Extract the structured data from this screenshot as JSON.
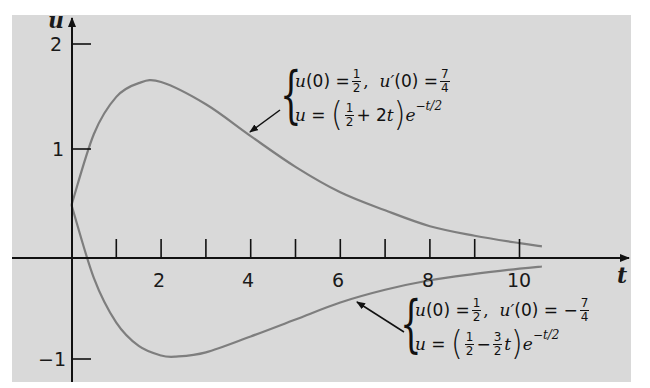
{
  "chart_data": {
    "type": "line",
    "title": "",
    "xlabel": "t",
    "ylabel": "u",
    "xlim": [
      0,
      11.8
    ],
    "ylim": [
      -1.15,
      2.2
    ],
    "x_ticks": [
      1,
      2,
      3,
      4,
      5,
      6,
      7,
      8,
      9,
      10
    ],
    "x_tick_labels": [
      "2",
      "4",
      "6",
      "8",
      "10"
    ],
    "x_tick_label_values": [
      2,
      4,
      6,
      8,
      10
    ],
    "y_ticks": [
      2,
      1,
      -1
    ],
    "y_tick_labels": [
      "2",
      "1",
      "−1"
    ],
    "grid": false,
    "legend": null,
    "series": [
      {
        "name": "upper",
        "formula": "(1/2 + 2t)e^(-t/2)",
        "initial_conditions": "u(0) = 1/2, u'(0) = 7/4",
        "t_range": [
          0,
          10.5
        ],
        "x": [
          0,
          0.5,
          1,
          1.5,
          2,
          3,
          4,
          5,
          6,
          7,
          8,
          9,
          10,
          10.5
        ],
        "values": [
          0.5,
          1.17,
          1.52,
          1.65,
          1.66,
          1.45,
          1.15,
          0.86,
          0.62,
          0.45,
          0.3,
          0.21,
          0.14,
          0.11
        ]
      },
      {
        "name": "lower",
        "formula": "(1/2 - 3/2 t)e^(-t/2)",
        "initial_conditions": "u(0) = 1/2, u'(0) = -7/4",
        "t_range": [
          0,
          10.5
        ],
        "x": [
          0,
          0.5,
          1,
          1.5,
          2,
          2.33,
          3,
          4,
          5,
          6,
          7,
          8,
          9,
          10,
          10.5
        ],
        "values": [
          0.5,
          -0.19,
          -0.61,
          -0.83,
          -0.92,
          -0.93,
          -0.89,
          -0.74,
          -0.58,
          -0.42,
          -0.3,
          -0.21,
          -0.15,
          -0.1,
          -0.08
        ]
      }
    ],
    "annotations": [
      {
        "target": "upper",
        "line1": "u(0) = 1/2,  u'(0) = 7/4",
        "line2": "u = (1/2 + 2t)e^(-t/2)"
      },
      {
        "target": "lower",
        "line1": "u(0) = 1/2,  u'(0) = −7/4",
        "line2": "u = (1/2 − 3/2 t)e^(-t/2)"
      }
    ]
  },
  "labels": {
    "x_axis": "t",
    "y_axis": "u",
    "y_tick_2": "2",
    "y_tick_1": "1",
    "y_tick_m1": "−1",
    "x_tick_2": "2",
    "x_tick_4": "4",
    "x_tick_6": "6",
    "x_tick_8": "8",
    "x_tick_10": "10"
  },
  "annot_upper": {
    "u0": "u",
    "u0_arg": "(0) =",
    "half_num": "1",
    "half_den": "2",
    "comma": ",",
    "up0": "u′",
    "up0_arg": "(0) =",
    "seven_num": "7",
    "seven_den": "4",
    "eq_u": "u",
    "eq_sign": "=",
    "lp": "(",
    "plus": "+ 2",
    "t": "t",
    "rp": ")",
    "e": "e",
    "exp": "−t/2"
  },
  "annot_lower": {
    "u0": "u",
    "u0_arg": "(0) =",
    "half_num": "1",
    "half_den": "2",
    "comma": ",",
    "up0": "u′",
    "up0_arg": "(0) = −",
    "seven_num": "7",
    "seven_den": "4",
    "eq_u": "u",
    "eq_sign": "=",
    "lp": "(",
    "minus": "−",
    "three_num": "3",
    "three_den": "2",
    "t": "t",
    "rp": ")",
    "e": "e",
    "exp": "−t/2"
  }
}
